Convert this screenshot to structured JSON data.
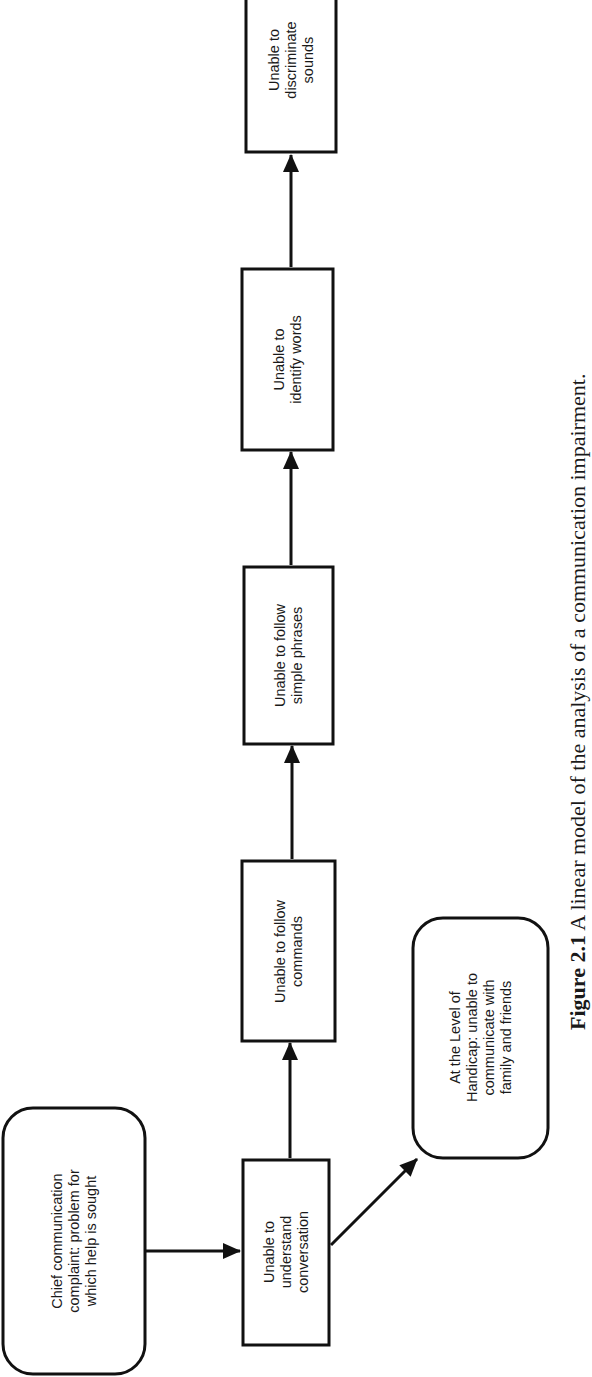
{
  "diagram": {
    "type": "linear-flowchart",
    "orientation": "rotated-90-ccw",
    "nodes": [
      {
        "id": "chief",
        "shape": "rounded-rect",
        "label": "Chief communication\ncomplaint: problem for\nwhich help is sought"
      },
      {
        "id": "conversation",
        "shape": "rect",
        "label": "Unable to\nunderstand\nconversation"
      },
      {
        "id": "commands",
        "shape": "rect",
        "label": "Unable to follow\ncommands"
      },
      {
        "id": "phrases",
        "shape": "rect",
        "label": "Unable to follow\nsimple phrases"
      },
      {
        "id": "words",
        "shape": "rect",
        "label": "Unable to\nidentify words"
      },
      {
        "id": "sounds",
        "shape": "rect",
        "label": "Unable to\ndiscriminate\nsounds"
      },
      {
        "id": "handicap",
        "shape": "rounded-rect",
        "label": "At the Level of\nHandicap: unable to\ncommunicate with\nfamily and friends"
      }
    ],
    "edges": [
      {
        "from": "chief",
        "to": "conversation"
      },
      {
        "from": "conversation",
        "to": "commands"
      },
      {
        "from": "commands",
        "to": "phrases"
      },
      {
        "from": "phrases",
        "to": "words"
      },
      {
        "from": "words",
        "to": "sounds"
      },
      {
        "from": "conversation",
        "to": "handicap"
      }
    ]
  },
  "caption": {
    "figure_number": "Figure 2.1",
    "text": "A linear model of the analysis of a communication impairment."
  },
  "colors": {
    "stroke": "#111111",
    "background": "#ffffff",
    "text": "#1a1a1a"
  }
}
